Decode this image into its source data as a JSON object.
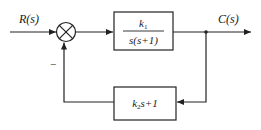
{
  "diagram": {
    "type": "feedback-control-block-diagram",
    "input": {
      "label": "R(s)"
    },
    "output": {
      "label": "C(s)"
    },
    "summing_junction": {
      "sign_feedback": "−"
    },
    "forward_block": {
      "numerator": "k",
      "numerator_sub": "1",
      "denominator": "s(s+1)"
    },
    "feedback_block": {
      "k": "k",
      "k_sub": "2",
      "rest": "s+1"
    },
    "colors": {
      "line": "#222222",
      "background": "#ffffff"
    }
  }
}
